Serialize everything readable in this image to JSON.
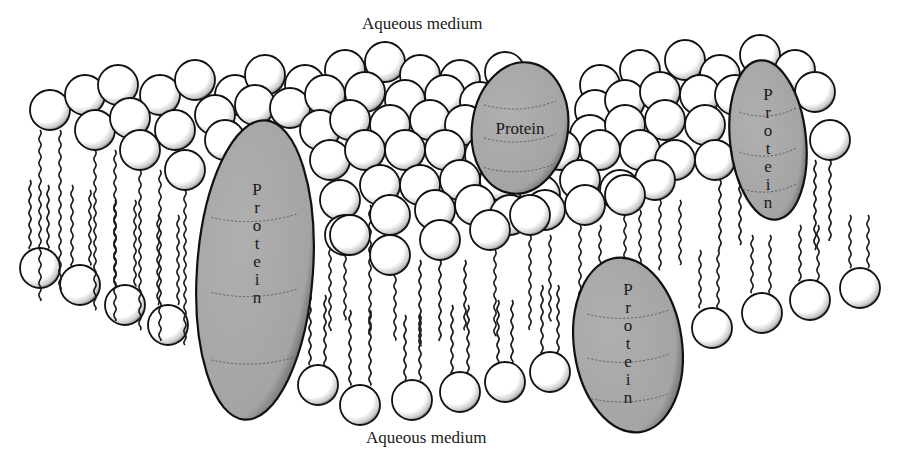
{
  "diagram": {
    "labels": {
      "top": "Aqueous medium",
      "bottom": "Aqueous medium",
      "protein": "Protein"
    },
    "colors": {
      "background": "#ffffff",
      "head_fill": "#ffffff",
      "head_stroke": "#111111",
      "head_shade": "#555555",
      "protein_fill": "#a9a9a9",
      "protein_stroke": "#111111",
      "tail_stroke": "#1a1a1a",
      "text": "#1a1a1a"
    },
    "head_radius": 20,
    "upper_heads": [
      [
        50,
        110
      ],
      [
        85,
        95
      ],
      [
        118,
        85
      ],
      [
        160,
        95
      ],
      [
        195,
        80
      ],
      [
        235,
        95
      ],
      [
        265,
        75
      ],
      [
        305,
        85
      ],
      [
        345,
        70
      ],
      [
        385,
        62
      ],
      [
        420,
        75
      ],
      [
        460,
        80
      ],
      [
        505,
        72
      ],
      [
        600,
        85
      ],
      [
        640,
        70
      ],
      [
        685,
        60
      ],
      [
        720,
        75
      ],
      [
        760,
        55
      ],
      [
        795,
        70
      ],
      [
        815,
        92
      ],
      [
        95,
        130
      ],
      [
        130,
        118
      ],
      [
        175,
        130
      ],
      [
        215,
        115
      ],
      [
        255,
        105
      ],
      [
        290,
        108
      ],
      [
        325,
        95
      ],
      [
        365,
        92
      ],
      [
        405,
        100
      ],
      [
        445,
        95
      ],
      [
        480,
        102
      ],
      [
        595,
        110
      ],
      [
        625,
        100
      ],
      [
        660,
        92
      ],
      [
        700,
        95
      ],
      [
        735,
        95
      ],
      [
        140,
        150
      ],
      [
        185,
        170
      ],
      [
        225,
        140
      ],
      [
        320,
        130
      ],
      [
        350,
        120
      ],
      [
        390,
        125
      ],
      [
        430,
        120
      ],
      [
        465,
        125
      ],
      [
        590,
        135
      ],
      [
        625,
        125
      ],
      [
        665,
        120
      ],
      [
        705,
        125
      ],
      [
        830,
        140
      ],
      [
        330,
        160
      ],
      [
        365,
        150
      ],
      [
        405,
        150
      ],
      [
        445,
        150
      ],
      [
        485,
        155
      ],
      [
        520,
        160
      ],
      [
        560,
        150
      ],
      [
        600,
        150
      ],
      [
        640,
        150
      ],
      [
        675,
        160
      ],
      [
        715,
        160
      ],
      [
        340,
        200
      ],
      [
        380,
        185
      ],
      [
        420,
        185
      ],
      [
        460,
        180
      ],
      [
        500,
        180
      ],
      [
        540,
        195
      ],
      [
        580,
        180
      ],
      [
        620,
        190
      ],
      [
        655,
        180
      ],
      [
        345,
        235
      ],
      [
        390,
        215
      ],
      [
        435,
        210
      ],
      [
        475,
        205
      ],
      [
        510,
        215
      ],
      [
        545,
        210
      ],
      [
        585,
        205
      ],
      [
        625,
        195
      ],
      [
        350,
        235
      ],
      [
        390,
        255
      ],
      [
        440,
        240
      ],
      [
        490,
        230
      ],
      [
        530,
        215
      ]
    ],
    "lower_heads": [
      [
        40,
        268
      ],
      [
        80,
        285
      ],
      [
        125,
        305
      ],
      [
        168,
        325
      ],
      [
        318,
        385
      ],
      [
        360,
        405
      ],
      [
        412,
        400
      ],
      [
        460,
        392
      ],
      [
        505,
        382
      ],
      [
        550,
        372
      ],
      [
        712,
        328
      ],
      [
        762,
        313
      ],
      [
        810,
        300
      ],
      [
        860,
        288
      ]
    ],
    "upper_tails": [
      [
        40,
        130,
        300
      ],
      [
        60,
        130,
        290
      ],
      [
        95,
        150,
        310
      ],
      [
        115,
        150,
        320
      ],
      [
        140,
        170,
        330
      ],
      [
        160,
        170,
        340
      ],
      [
        185,
        190,
        345
      ],
      [
        330,
        220,
        330
      ],
      [
        345,
        220,
        320
      ],
      [
        370,
        205,
        335
      ],
      [
        395,
        205,
        340
      ],
      [
        420,
        260,
        345
      ],
      [
        440,
        260,
        340
      ],
      [
        465,
        260,
        330
      ],
      [
        495,
        250,
        335
      ],
      [
        530,
        235,
        330
      ],
      [
        550,
        235,
        320
      ],
      [
        580,
        225,
        300
      ],
      [
        600,
        225,
        295
      ],
      [
        625,
        210,
        280
      ],
      [
        640,
        210,
        275
      ],
      [
        660,
        200,
        270
      ],
      [
        680,
        200,
        265
      ],
      [
        720,
        180,
        250
      ],
      [
        740,
        180,
        245
      ],
      [
        815,
        160,
        250
      ],
      [
        830,
        160,
        240
      ]
    ],
    "lower_tails": [
      [
        30,
        180,
        248
      ],
      [
        48,
        185,
        248
      ],
      [
        72,
        185,
        265
      ],
      [
        90,
        190,
        265
      ],
      [
        115,
        200,
        285
      ],
      [
        135,
        200,
        285
      ],
      [
        158,
        215,
        305
      ],
      [
        178,
        215,
        305
      ],
      [
        310,
        295,
        365
      ],
      [
        325,
        295,
        365
      ],
      [
        350,
        310,
        385
      ],
      [
        370,
        310,
        385
      ],
      [
        405,
        315,
        380
      ],
      [
        420,
        315,
        380
      ],
      [
        452,
        305,
        372
      ],
      [
        468,
        305,
        372
      ],
      [
        498,
        300,
        362
      ],
      [
        512,
        300,
        362
      ],
      [
        542,
        285,
        352
      ],
      [
        558,
        285,
        352
      ],
      [
        700,
        250,
        308
      ],
      [
        718,
        250,
        308
      ],
      [
        752,
        235,
        293
      ],
      [
        770,
        235,
        293
      ],
      [
        800,
        225,
        280
      ],
      [
        818,
        225,
        280
      ],
      [
        850,
        215,
        268
      ],
      [
        868,
        215,
        268
      ]
    ],
    "proteins": [
      {
        "id": "protein-large-left",
        "label_orientation": "vertical",
        "cx": 255,
        "cy": 270,
        "rx": 58,
        "ry": 150,
        "rotate": 4,
        "label_x": 257,
        "label_y": 195
      },
      {
        "id": "protein-top-center",
        "label_orientation": "horizontal",
        "cx": 520,
        "cy": 128,
        "rx": 48,
        "ry": 66,
        "rotate": 8,
        "label_x": 520,
        "label_y": 134
      },
      {
        "id": "protein-right",
        "label_orientation": "vertical",
        "cx": 768,
        "cy": 140,
        "rx": 38,
        "ry": 80,
        "rotate": -6,
        "label_x": 768,
        "label_y": 100
      },
      {
        "id": "protein-bottom-right",
        "label_orientation": "vertical",
        "cx": 628,
        "cy": 345,
        "rx": 54,
        "ry": 88,
        "rotate": -8,
        "label_x": 628,
        "label_y": 295
      }
    ]
  }
}
